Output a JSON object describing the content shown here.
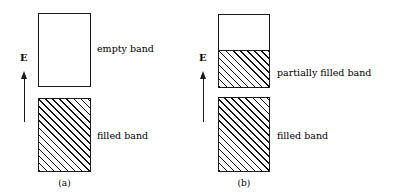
{
  "figure": {
    "background_color": "#ffffff",
    "line_color": "#1a1a1a",
    "hatch_color": "#111111"
  },
  "panels": [
    {
      "id": "a",
      "caption": "(a)",
      "axis": {
        "label": "E",
        "icon": "up-arrow-icon",
        "direction": "up",
        "meaning": "increasing energy"
      },
      "bands": [
        {
          "id": "empty-band",
          "label": "empty band",
          "fill": "none",
          "fill_fraction": 0
        },
        {
          "id": "filled-band",
          "label": "filled band",
          "fill": "hatched",
          "fill_fraction": 1
        }
      ]
    },
    {
      "id": "b",
      "caption": "(b)",
      "axis": {
        "label": "E",
        "icon": "up-arrow-icon",
        "direction": "up",
        "meaning": "increasing energy"
      },
      "bands": [
        {
          "id": "partially-filled-band",
          "label": "partially filled band",
          "fill": "hatched-partial",
          "fill_fraction": 0.5
        },
        {
          "id": "filled-band",
          "label": "filled band",
          "fill": "hatched",
          "fill_fraction": 1
        }
      ]
    }
  ]
}
